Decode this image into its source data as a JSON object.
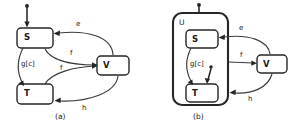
{
  "figure": {
    "caption_a": "(a)",
    "caption_b": "(b)",
    "diagram_a": {
      "states": [
        {
          "id": "S",
          "label": "S"
        },
        {
          "id": "T",
          "label": "T"
        },
        {
          "id": "V",
          "label": "V"
        }
      ],
      "transitions": [
        {
          "from": "initial",
          "to": "S",
          "label": ""
        },
        {
          "from": "V",
          "to": "S",
          "label": "e"
        },
        {
          "from": "S",
          "to": "V",
          "label": "f"
        },
        {
          "from": "T",
          "to": "V",
          "label": "f"
        },
        {
          "from": "S",
          "to": "T",
          "label": "g[c]"
        },
        {
          "from": "V",
          "to": "T",
          "label": "h"
        }
      ]
    },
    "diagram_b": {
      "composite": {
        "id": "U",
        "label": "U"
      },
      "states": [
        {
          "id": "S",
          "label": "S"
        },
        {
          "id": "T",
          "label": "T"
        },
        {
          "id": "V",
          "label": "V"
        }
      ],
      "transitions": [
        {
          "from": "initial",
          "to": "S",
          "label": ""
        },
        {
          "from": "V",
          "to": "S",
          "label": "e"
        },
        {
          "from": "U",
          "to": "V",
          "label": "f"
        },
        {
          "from": "S",
          "to": "T",
          "label": "g[c]"
        },
        {
          "from": "V",
          "to": "U",
          "label": "h"
        },
        {
          "from": "initial2",
          "to": "T",
          "label": ""
        }
      ]
    },
    "colors": {
      "stroke": "#262626",
      "edge": "#3a3a3a",
      "background": "#ffffff",
      "text": "#1a1a1a"
    }
  }
}
